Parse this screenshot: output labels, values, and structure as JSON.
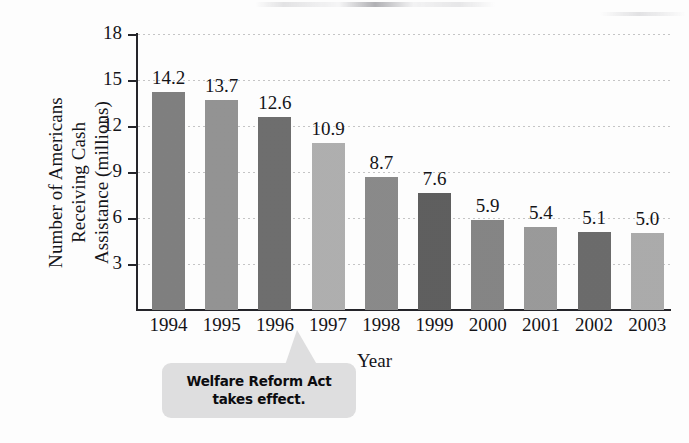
{
  "chart_data": {
    "type": "bar",
    "title": "",
    "xlabel": "Year",
    "ylabel": "Number of Americans\nReceiving Cash\nAssistance (millions)",
    "categories": [
      "1994",
      "1995",
      "1996",
      "1997",
      "1998",
      "1999",
      "2000",
      "2001",
      "2002",
      "2003"
    ],
    "values": [
      14.2,
      13.7,
      12.6,
      10.9,
      8.7,
      7.6,
      5.9,
      5.4,
      5.1,
      5.0
    ],
    "value_labels": [
      "14.2",
      "13.7",
      "12.6",
      "10.9",
      "8.7",
      "7.6",
      "5.9",
      "5.4",
      "5.1",
      "5.0"
    ],
    "bar_colors": [
      "#7f7f7f",
      "#949494",
      "#6d6d6d",
      "#b1b1b1",
      "#8a8a8a",
      "#5d5d5d",
      "#858585",
      "#9b9b9b",
      "#6a6a6a",
      "#adadad"
    ],
    "ylim": [
      0,
      18
    ],
    "yticks": [
      3,
      6,
      9,
      12,
      15,
      18
    ],
    "ytick_labels": [
      "3",
      "6",
      "9",
      "12",
      "15",
      "18"
    ],
    "grid": true,
    "grid_style": "dotted-horizontal",
    "legend": "none",
    "annotations": [
      {
        "name": "welfare-reform-callout",
        "lines": [
          "Welfare Reform Act",
          "takes effect."
        ],
        "points_to": "1997",
        "background": "#dededf"
      }
    ]
  },
  "axis": {
    "y_title_lines": [
      "Number of Americans",
      "Receiving Cash",
      "Assistance (millions)"
    ],
    "x_title": "Year"
  }
}
